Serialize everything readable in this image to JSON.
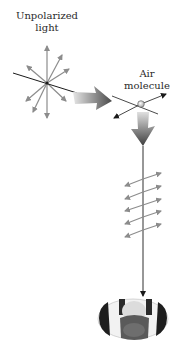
{
  "labels": {
    "unpolarized_line1": "Unpolarized",
    "unpolarized_line2": "light",
    "air_line1": "Air",
    "air_line2": "molecule"
  },
  "colors": {
    "background": "#ffffff",
    "arrow_gray": "#8c8c8c",
    "line_black": "#1a1a1a",
    "molecule_fill": "#d8d8d8"
  }
}
